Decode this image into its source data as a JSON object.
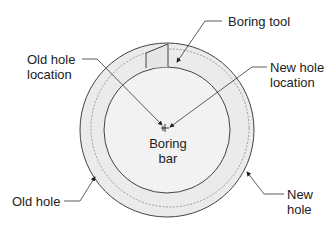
{
  "labels": {
    "boring_tool": "Boring tool",
    "old_hole_location": [
      "Old hole",
      "location"
    ],
    "new_hole_location": [
      "New hole",
      "location"
    ],
    "boring_bar": [
      "Boring",
      "bar"
    ],
    "old_hole": "Old hole",
    "new_hole": [
      "New",
      "hole"
    ]
  },
  "colors": {
    "outer_fill": "#ebebeb",
    "inner_fill": "#f2f2f2",
    "stroke": "#444444",
    "dashed": "#888888"
  }
}
